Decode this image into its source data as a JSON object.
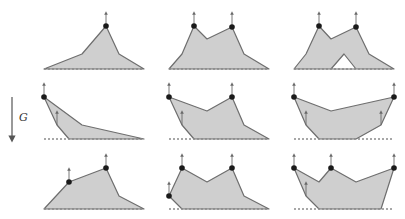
{
  "gravity": {
    "label": "G",
    "arrow": {
      "x": 12,
      "y1": 97,
      "y2": 139
    },
    "label_pos": {
      "x": 19,
      "y": 121
    }
  },
  "colors": {
    "fill": "#cfcfcf",
    "edge": "#6e6e6e",
    "vertex": "#1a1a1a",
    "ground": "#8a8a8a"
  },
  "panels": [
    {
      "id": "r1c1",
      "ground": [
        44,
        69,
        144,
        69
      ],
      "polygon": [
        [
          44,
          69
        ],
        [
          82,
          54
        ],
        [
          106,
          26
        ],
        [
          119,
          54
        ],
        [
          144,
          69
        ]
      ],
      "holes": [],
      "vertices": [
        [
          106,
          26
        ]
      ],
      "forces": [
        [
          106,
          26,
          106,
          13
        ]
      ]
    },
    {
      "id": "r1c2",
      "ground": [
        169,
        69,
        269,
        69
      ],
      "polygon": [
        [
          169,
          69
        ],
        [
          182,
          54
        ],
        [
          194,
          26
        ],
        [
          207,
          39
        ],
        [
          232,
          27
        ],
        [
          244,
          54
        ],
        [
          269,
          69
        ]
      ],
      "holes": [],
      "vertices": [
        [
          194,
          26
        ],
        [
          232,
          27
        ]
      ],
      "forces": [
        [
          194,
          26,
          194,
          13
        ],
        [
          232,
          27,
          232,
          13
        ]
      ]
    },
    {
      "id": "r1c3",
      "ground": [
        294,
        69,
        394,
        69
      ],
      "polygon": [
        [
          294,
          69
        ],
        [
          306,
          54
        ],
        [
          319,
          26
        ],
        [
          331,
          39
        ],
        [
          356,
          27
        ],
        [
          369,
          54
        ],
        [
          394,
          69
        ]
      ],
      "holes": [
        [
          [
            331,
            69
          ],
          [
            344,
            54
          ],
          [
            356,
            69
          ]
        ]
      ],
      "vertices": [
        [
          319,
          26
        ],
        [
          356,
          27
        ]
      ],
      "forces": [
        [
          319,
          26,
          319,
          13
        ],
        [
          356,
          27,
          356,
          13
        ]
      ]
    },
    {
      "id": "r2c1",
      "ground": [
        44,
        139,
        144,
        139
      ],
      "polygon": [
        [
          44,
          97
        ],
        [
          82,
          125
        ],
        [
          144,
          139
        ],
        [
          69,
          139
        ],
        [
          57,
          125
        ]
      ],
      "holes": [],
      "vertices": [
        [
          44,
          97
        ]
      ],
      "forces": [
        [
          44,
          97,
          44,
          84
        ],
        [
          57,
          125,
          57,
          112
        ]
      ]
    },
    {
      "id": "r2c2",
      "ground": [
        169,
        139,
        269,
        139
      ],
      "polygon": [
        [
          169,
          97
        ],
        [
          207,
          111
        ],
        [
          232,
          97
        ],
        [
          244,
          125
        ],
        [
          269,
          139
        ],
        [
          194,
          139
        ],
        [
          182,
          125
        ]
      ],
      "holes": [],
      "vertices": [
        [
          169,
          97
        ],
        [
          232,
          97
        ]
      ],
      "forces": [
        [
          169,
          97,
          169,
          84
        ],
        [
          232,
          97,
          232,
          84
        ],
        [
          182,
          125,
          182,
          112
        ]
      ]
    },
    {
      "id": "r2c3",
      "ground": [
        294,
        139,
        394,
        139
      ],
      "polygon": [
        [
          294,
          97
        ],
        [
          331,
          111
        ],
        [
          394,
          97
        ],
        [
          381,
          125
        ],
        [
          356,
          139
        ],
        [
          319,
          139
        ],
        [
          306,
          125
        ]
      ],
      "holes": [],
      "vertices": [
        [
          294,
          97
        ],
        [
          394,
          97
        ]
      ],
      "forces": [
        [
          294,
          97,
          294,
          84
        ],
        [
          394,
          97,
          394,
          84
        ],
        [
          306,
          125,
          306,
          112
        ],
        [
          381,
          125,
          381,
          112
        ]
      ]
    },
    {
      "id": "r3c1",
      "ground": [
        44,
        209,
        144,
        209
      ],
      "polygon": [
        [
          44,
          209
        ],
        [
          69,
          182
        ],
        [
          106,
          168
        ],
        [
          119,
          196
        ],
        [
          144,
          209
        ]
      ],
      "holes": [],
      "vertices": [
        [
          69,
          182
        ],
        [
          106,
          168
        ]
      ],
      "forces": [
        [
          69,
          182,
          69,
          169
        ],
        [
          106,
          168,
          106,
          155
        ]
      ]
    },
    {
      "id": "r3c2",
      "ground": [
        169,
        209,
        269,
        209
      ],
      "polygon": [
        [
          169,
          196
        ],
        [
          182,
          168
        ],
        [
          207,
          182
        ],
        [
          232,
          168
        ],
        [
          244,
          196
        ],
        [
          269,
          209
        ],
        [
          182,
          209
        ]
      ],
      "holes": [],
      "vertices": [
        [
          169,
          196
        ],
        [
          182,
          168
        ],
        [
          232,
          168
        ]
      ],
      "forces": [
        [
          169,
          196,
          169,
          183
        ],
        [
          182,
          168,
          182,
          155
        ],
        [
          232,
          168,
          232,
          155
        ]
      ]
    },
    {
      "id": "r3c3",
      "ground": [
        294,
        209,
        394,
        209
      ],
      "polygon": [
        [
          294,
          168
        ],
        [
          319,
          182
        ],
        [
          331,
          168
        ],
        [
          356,
          182
        ],
        [
          394,
          168
        ],
        [
          381,
          209
        ],
        [
          319,
          209
        ],
        [
          306,
          196
        ]
      ],
      "holes": [],
      "vertices": [
        [
          294,
          168
        ],
        [
          331,
          168
        ],
        [
          394,
          168
        ]
      ],
      "forces": [
        [
          294,
          168,
          294,
          155
        ],
        [
          331,
          168,
          331,
          155
        ],
        [
          394,
          168,
          394,
          155
        ],
        [
          306,
          196,
          306,
          183
        ]
      ]
    }
  ]
}
